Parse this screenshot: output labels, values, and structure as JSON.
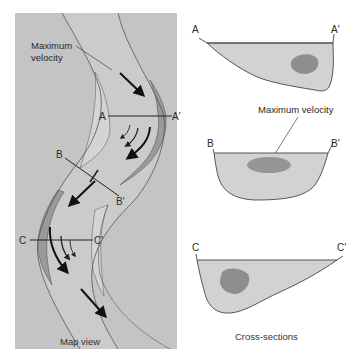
{
  "map_view": {
    "caption": "Map view",
    "callout_label_line1": "Maximum",
    "callout_label_line2": "velocity",
    "section_lines": [
      {
        "start": "A",
        "end": "A′"
      },
      {
        "start": "B",
        "end": "B′"
      },
      {
        "start": "C",
        "end": "C′"
      }
    ]
  },
  "cross_sections": {
    "caption": "Cross-sections",
    "callout_label": "Maximum velocity",
    "sections": [
      {
        "start": "A",
        "end": "A′",
        "max_velocity_position": "right (outer bank)"
      },
      {
        "start": "B",
        "end": "B′",
        "max_velocity_position": "center"
      },
      {
        "start": "C",
        "end": "C′",
        "max_velocity_position": "left (outer bank)"
      }
    ]
  },
  "colors": {
    "map_background": "#c4c4c4",
    "channel_fill": "#cbcbcb",
    "point_bar_fill": "#d6d6d6",
    "cutbank_fill": "#9a9a9a",
    "section_fill": "#d2d2d2",
    "max_velocity_fill": "#8e8e8e",
    "line": "#3a3a3a",
    "arrow": "#111111"
  }
}
